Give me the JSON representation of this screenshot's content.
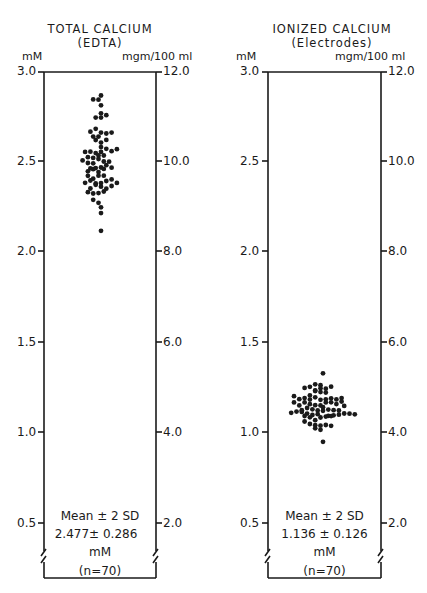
{
  "chart_data": [
    {
      "type": "scatter",
      "subtype": "dot-plot",
      "title": "TOTAL CALCIUM",
      "subtitle": "(EDTA)",
      "ylabel_left": "mM",
      "ylabel_right": "mgm/100 ml",
      "ylim": [
        0.5,
        3.0
      ],
      "yticks_left": [
        "3.0",
        "2.5",
        "2.0",
        "1.5",
        "1.0",
        "0.5"
      ],
      "yticks_right": [
        "12.0",
        "10.0",
        "8.0",
        "6.0",
        "4.0",
        "2.0"
      ],
      "n": 70,
      "mean": 2.477,
      "two_sd": 0.286,
      "range_approx": [
        2.12,
        2.87
      ],
      "annotation": [
        "Mean ± 2 SD",
        "2.477± 0.286",
        "mM",
        "(n=70)"
      ]
    },
    {
      "type": "scatter",
      "subtype": "dot-plot",
      "title": "IONIZED CALCIUM",
      "subtitle": "(Electrodes)",
      "ylabel_left": "mM",
      "ylabel_right": "mgm/100 ml",
      "ylim": [
        0.5,
        3.0
      ],
      "yticks_left": [
        "3.0",
        "2.5",
        "2.0",
        "1.5",
        "1.0",
        "0.5"
      ],
      "yticks_right": [
        "12.0",
        "10.0",
        "8.0",
        "6.0",
        "4.0",
        "2.0"
      ],
      "n": 70,
      "mean": 1.136,
      "two_sd": 0.126,
      "range_approx": [
        0.95,
        1.33
      ],
      "annotation": [
        "Mean ± 2 SD",
        "1.136 ± 0.126",
        "mM",
        "(n=70)"
      ]
    }
  ],
  "left": {
    "title": "TOTAL CALCIUM",
    "subtitle": "(EDTA)",
    "unit_left": "mM",
    "unit_right": "mgm/100 ml",
    "ticks_left": [
      "3.0",
      "2.5",
      "2.0",
      "1.5",
      "1.0",
      "0.5"
    ],
    "ticks_right": [
      "12.0",
      "10.0",
      "8.0",
      "6.0",
      "4.0",
      "2.0"
    ],
    "stat_label": "Mean ± 2 SD",
    "stat_value": "2.477± 0.286",
    "stat_unit": "mM",
    "stat_n": "(n=70)"
  },
  "right": {
    "title": "IONIZED CALCIUM",
    "subtitle": "(Electrodes)",
    "unit_left": "mM",
    "unit_right": "mgm/100 ml",
    "ticks_left": [
      "3.0",
      "2.5",
      "2.0",
      "1.5",
      "1.0",
      "0.5"
    ],
    "ticks_right": [
      "12.0",
      "10.0",
      "8.0",
      "6.0",
      "4.0",
      "2.0"
    ],
    "stat_label": "Mean ± 2 SD",
    "stat_value": "1.136 ± 0.126",
    "stat_unit": "mM",
    "stat_n": "(n=70)"
  },
  "colors": {
    "ink": "#1a1a1a",
    "background": "#ffffff"
  }
}
